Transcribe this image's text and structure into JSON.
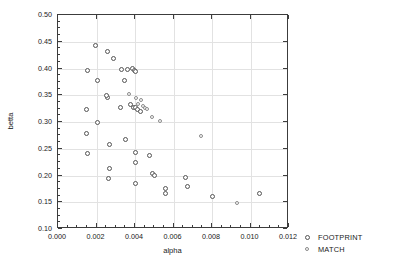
{
  "chart_data": {
    "type": "scatter",
    "title": "",
    "xlabel": "alpha",
    "ylabel": "betta",
    "xlim": [
      0.0,
      0.012
    ],
    "ylim": [
      0.1,
      0.5
    ],
    "xticks": [
      0.0,
      0.002,
      0.004,
      0.006,
      0.008,
      0.01,
      0.012
    ],
    "xticklabels": [
      "0.000",
      "0.002",
      "0.004",
      "0.006",
      "0.008",
      "0.010",
      "0.012"
    ],
    "yticks": [
      0.1,
      0.15,
      0.2,
      0.25,
      0.3,
      0.35,
      0.4,
      0.45,
      0.5
    ],
    "yticklabels": [
      "0.10",
      "0.15",
      "0.20",
      "0.25",
      "0.30",
      "0.35",
      "0.40",
      "0.45",
      "0.50"
    ],
    "grid": true,
    "legend_position": "right-bottom-outside",
    "series": [
      {
        "name": "FOOTPRINT",
        "marker": "open-circle",
        "color": "#555555",
        "points": [
          [
            0.00155,
            0.3955
          ],
          [
            0.00195,
            0.443
          ],
          [
            0.00205,
            0.3785
          ],
          [
            0.00255,
            0.4325
          ],
          [
            0.0029,
            0.419
          ],
          [
            0.0015,
            0.3225
          ],
          [
            0.00255,
            0.3465
          ],
          [
            0.0033,
            0.3985
          ],
          [
            0.0036,
            0.399
          ],
          [
            0.00385,
            0.3995
          ],
          [
            0.00395,
            0.396
          ],
          [
            0.004,
            0.394
          ],
          [
            0.00345,
            0.378
          ],
          [
            0.00325,
            0.327
          ],
          [
            0.00375,
            0.332
          ],
          [
            0.0039,
            0.328
          ],
          [
            0.004,
            0.3265
          ],
          [
            0.00415,
            0.323
          ],
          [
            0.0043,
            0.3195
          ],
          [
            0.0025,
            0.349
          ],
          [
            0.0015,
            0.2785
          ],
          [
            0.00205,
            0.299
          ],
          [
            0.00155,
            0.242
          ],
          [
            0.00265,
            0.2575
          ],
          [
            0.00265,
            0.214
          ],
          [
            0.0026,
            0.1945
          ],
          [
            0.0035,
            0.2665
          ],
          [
            0.00405,
            0.2425
          ],
          [
            0.00405,
            0.2235
          ],
          [
            0.00475,
            0.237
          ],
          [
            0.00405,
            0.1845
          ],
          [
            0.0049,
            0.204
          ],
          [
            0.005,
            0.2
          ],
          [
            0.0056,
            0.1765
          ],
          [
            0.0056,
            0.1665
          ],
          [
            0.0066,
            0.1955
          ],
          [
            0.00675,
            0.18
          ],
          [
            0.00805,
            0.1605
          ],
          [
            0.01045,
            0.1655
          ]
        ]
      },
      {
        "name": "MATCH",
        "marker": "open-circle-small",
        "color": "#8a8a8a",
        "points": [
          [
            0.0037,
            0.352
          ],
          [
            0.00405,
            0.3455
          ],
          [
            0.0043,
            0.342
          ],
          [
            0.00415,
            0.334
          ],
          [
            0.0044,
            0.33
          ],
          [
            0.0045,
            0.327
          ],
          [
            0.0046,
            0.3235
          ],
          [
            0.0049,
            0.3095
          ],
          [
            0.0053,
            0.301
          ],
          [
            0.00745,
            0.2735
          ],
          [
            0.0093,
            0.149
          ]
        ]
      }
    ]
  },
  "legend": {
    "items": [
      {
        "label": "FOOTPRINT",
        "series": "footprint"
      },
      {
        "label": "MATCH",
        "series": "match"
      }
    ]
  }
}
